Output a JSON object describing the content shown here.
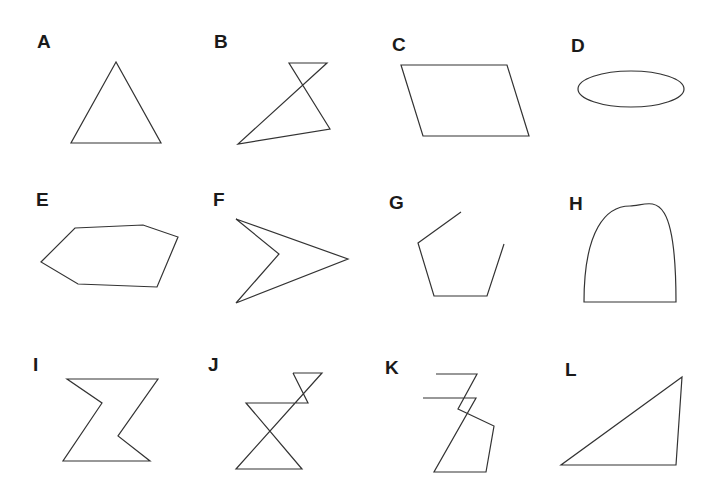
{
  "figure": {
    "panels": [
      {
        "label": "A",
        "shape": "equilateral triangle"
      },
      {
        "label": "B",
        "shape": "self-intersecting quadrilateral"
      },
      {
        "label": "C",
        "shape": "parallelogram"
      },
      {
        "label": "D",
        "shape": "ellipse"
      },
      {
        "label": "E",
        "shape": "irregular hexagon"
      },
      {
        "label": "F",
        "shape": "concave quadrilateral (arrowhead)"
      },
      {
        "label": "G",
        "shape": "open pentagon"
      },
      {
        "label": "H",
        "shape": "arch (semi-ellipse on base)"
      },
      {
        "label": "I",
        "shape": "hourglass-like polygon"
      },
      {
        "label": "J",
        "shape": "self-intersecting polygon (double hourglass)"
      },
      {
        "label": "K",
        "shape": "open self-intersecting polyline"
      },
      {
        "label": "L",
        "shape": "right-ish triangle"
      }
    ],
    "stroke_color": "#333333",
    "background": "#ffffff"
  }
}
